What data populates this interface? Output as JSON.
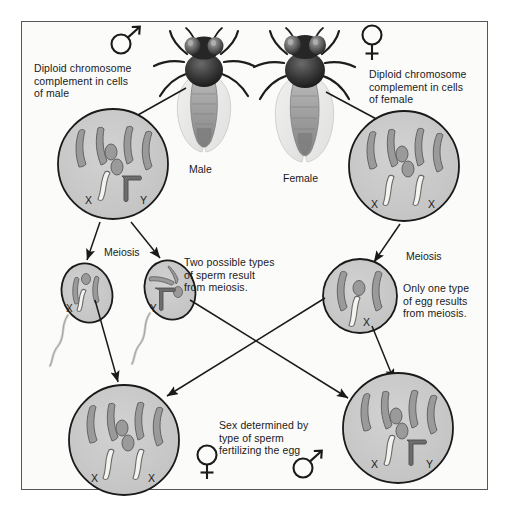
{
  "figure": {
    "background": "#fbfbfa",
    "frame_color": "#56565a"
  },
  "symbols": {
    "male_glyph": "male-symbol",
    "female_glyph": "female-symbol"
  },
  "colors": {
    "cell_fill": "#c9c9c9",
    "cell_stroke": "#1a1a1a",
    "autosome": "#8f8f8f",
    "autosome_stroke": "#5e5e5e",
    "x_chromosome": "#f2f2ee",
    "x_chromosome_stroke": "#5e5e5e",
    "y_chromosome": "#6e6e6e",
    "arrow": "#1a1a1a",
    "text": "#1a1a1a",
    "fly_head": "#2b2b2b",
    "fly_body": "#9a9a9a",
    "fly_wing": "#e3e3e0"
  },
  "labels": {
    "male_cell_caption": "Diploid chromosome\ncomplement in cells\nof male",
    "female_cell_caption": "Diploid chromosome\ncomplement in cells\nof female",
    "male_fly": "Male",
    "female_fly": "Female",
    "meiosis_left": "Meiosis",
    "meiosis_right": "Meiosis",
    "sperm_caption": "Two possible types\nof sperm result\nfrom meiosis.",
    "egg_caption": "Only one type\nof egg results\nfrom meiosis.",
    "fertilization_caption": "Sex determined by\ntype of sperm\nfertilizing the egg"
  },
  "chromosome_marks": {
    "male_cell_x": "X",
    "male_cell_y": "Y",
    "female_cell_x1": "X",
    "female_cell_x2": "X",
    "sperm_x": "X",
    "sperm_y": "Y",
    "egg_x": "X",
    "daughter_female_x1": "X",
    "daughter_female_x2": "X",
    "daughter_male_x": "X",
    "daughter_male_y": "Y"
  },
  "cells": [
    {
      "id": "male-diploid-cell",
      "name": "Diploid male cell",
      "ploidy": "diploid",
      "autosomes": 4,
      "dot_chromosomes": 2,
      "sex_chromosomes": [
        "X",
        "Y"
      ]
    },
    {
      "id": "female-diploid-cell",
      "name": "Diploid female cell",
      "ploidy": "diploid",
      "autosomes": 4,
      "dot_chromosomes": 2,
      "sex_chromosomes": [
        "X",
        "X"
      ]
    },
    {
      "id": "sperm-x-cell",
      "name": "X-bearing sperm",
      "ploidy": "haploid",
      "autosomes": 2,
      "dot_chromosomes": 1,
      "sex_chromosomes": [
        "X"
      ]
    },
    {
      "id": "sperm-y-cell",
      "name": "Y-bearing sperm",
      "ploidy": "haploid",
      "autosomes": 2,
      "dot_chromosomes": 1,
      "sex_chromosomes": [
        "Y"
      ]
    },
    {
      "id": "egg-cell",
      "name": "Egg",
      "ploidy": "haploid",
      "autosomes": 2,
      "dot_chromosomes": 1,
      "sex_chromosomes": [
        "X"
      ]
    },
    {
      "id": "offspring-female-cell",
      "name": "Female offspring zygote",
      "ploidy": "diploid",
      "autosomes": 4,
      "dot_chromosomes": 2,
      "sex_chromosomes": [
        "X",
        "X"
      ]
    },
    {
      "id": "offspring-male-cell",
      "name": "Male offspring zygote",
      "ploidy": "diploid",
      "autosomes": 4,
      "dot_chromosomes": 2,
      "sex_chromosomes": [
        "X",
        "Y"
      ]
    }
  ]
}
